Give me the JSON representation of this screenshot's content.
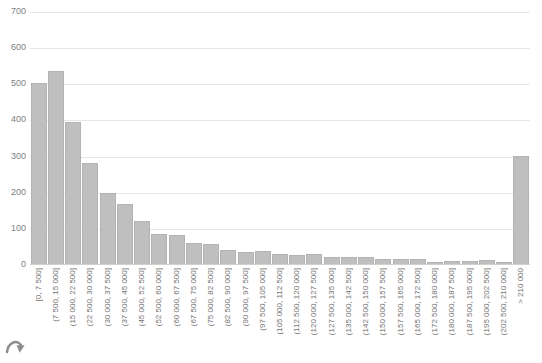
{
  "chart_data": {
    "type": "bar",
    "title": "",
    "subtitle": "",
    "xlabel": "",
    "ylabel": "",
    "ylim": [
      0,
      700
    ],
    "yticks": [
      0,
      100,
      200,
      300,
      400,
      500,
      600,
      700
    ],
    "grid": true,
    "legend": false,
    "legend_position": "none",
    "bar_color": "#bfbfbf",
    "bar_edge_color": "#b3b3b3",
    "categories": [
      "[0, 7 500]",
      "(7 500, 15 000]",
      "(15 000, 22 500]",
      "(22 500, 30 000]",
      "(30 000, 37 500]",
      "(37 500, 45 000]",
      "(45 000, 52 500]",
      "(52 500, 60 000]",
      "(60 000, 67 500]",
      "(67 500, 75 000]",
      "(75 000, 82 500]",
      "(82 500, 90 000]",
      "(90 000, 97 500]",
      "(97 500, 105 000]",
      "(105 000, 112 500]",
      "(112 500, 120 000]",
      "(120 000, 127 500]",
      "(127 500, 135 000]",
      "(135 000, 142 500]",
      "(142 500, 150 000]",
      "(150 000, 157 500]",
      "(157 500, 165 000]",
      "(165 000, 172 500]",
      "(172 500, 180 000]",
      "(180 000, 187 500]",
      "(187 500, 195 000]",
      "(195 000, 202 500]",
      "(202 500, 210 000]",
      "> 210 000"
    ],
    "values": [
      503,
      538,
      397,
      283,
      200,
      170,
      122,
      86,
      83,
      60,
      57,
      41,
      37,
      40,
      30,
      28,
      30,
      22,
      21,
      21,
      18,
      18,
      16,
      9,
      12,
      12,
      14,
      8,
      303
    ]
  },
  "icons": {
    "corner_arrow": "curved-arrow"
  }
}
